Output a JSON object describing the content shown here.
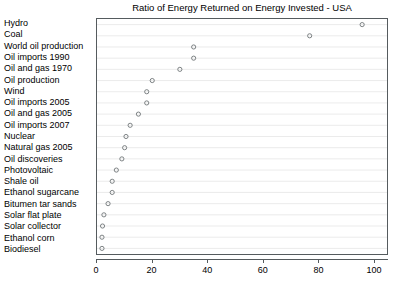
{
  "chart_data": {
    "type": "scatter",
    "title": "Ratio of Energy Returned on Energy Invested - USA",
    "xlabel": "",
    "ylabel": "",
    "xlim": [
      0,
      105
    ],
    "xticks": [
      0,
      20,
      40,
      60,
      80,
      100
    ],
    "xtick_labels": [
      "0",
      "20",
      "40",
      "60",
      "80",
      "100"
    ],
    "grid": true,
    "grid_axis": "y",
    "legend": false,
    "marker": "open-circle",
    "marker_color": "#6e7476",
    "orientation": "horizontal",
    "categories": [
      "Hydro",
      "Coal",
      "World oil production",
      "Oil imports 1990",
      "Oil and gas 1970",
      "Oil production",
      "Wind",
      "Oil imports 2005",
      "Oil and gas 2005",
      "Oil imports 2007",
      "Nuclear",
      "Natural gas 2005",
      "Oil discoveries",
      "Photovoltaic",
      "Shale oil",
      "Ethanol sugarcane",
      "Bitumen tar sands",
      "Solar flat plate",
      "Solar collector",
      "Ethanol corn",
      "Biodiesel"
    ],
    "values": [
      96,
      77,
      35,
      35,
      30,
      20,
      18,
      18,
      15,
      12,
      10.5,
      10,
      9,
      7,
      5.5,
      5.5,
      4,
      2.5,
      2,
      1.8,
      1.8
    ]
  }
}
